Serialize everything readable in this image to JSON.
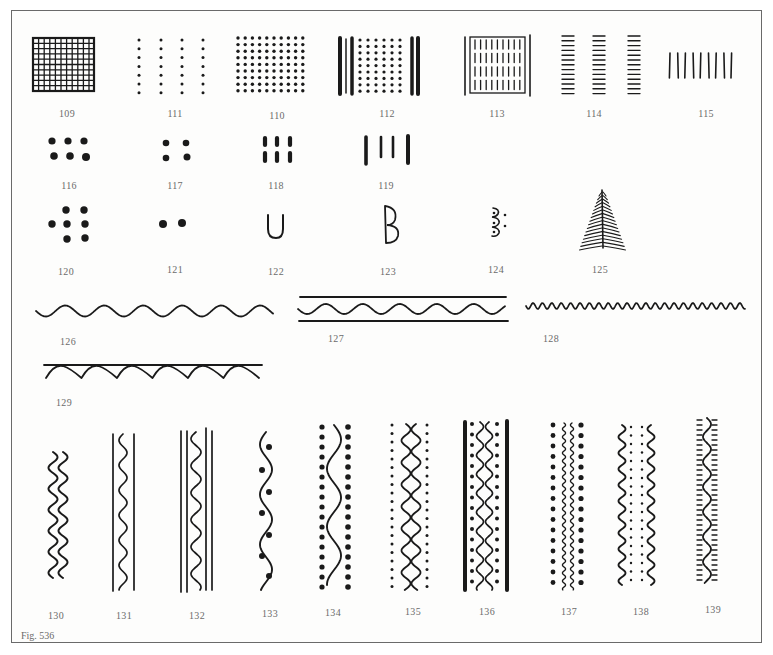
{
  "figure": {
    "caption": "Fig. 536",
    "ink_color": "#1a1a1a",
    "label_color": "#6b6b6b",
    "border_color": "#6a6a6a"
  },
  "motifs": [
    {
      "id": "109",
      "label": "109",
      "type": "cross-hatched grid square",
      "x": 67,
      "y": 108
    },
    {
      "id": "111",
      "label": "111",
      "type": "four vertical columns of dots",
      "x": 175,
      "y": 108
    },
    {
      "id": "110",
      "label": "110",
      "type": "dense square dot grid",
      "x": 277,
      "y": 110
    },
    {
      "id": "112",
      "label": "112",
      "type": "dot grid flanked by vertical bars",
      "x": 387,
      "y": 108
    },
    {
      "id": "113",
      "label": "113",
      "type": "framed vertical hatching in rows",
      "x": 497,
      "y": 108
    },
    {
      "id": "114",
      "label": "114",
      "type": "three columns of horizontal dashes",
      "x": 594,
      "y": 108
    },
    {
      "id": "115",
      "label": "115",
      "type": "row of vertical strokes",
      "x": 706,
      "y": 108
    },
    {
      "id": "116",
      "label": "116",
      "type": "six dots in 3x2 block",
      "x": 69,
      "y": 180
    },
    {
      "id": "117",
      "label": "117",
      "type": "four dots in 2x2 block",
      "x": 175,
      "y": 180
    },
    {
      "id": "118",
      "label": "118",
      "type": "six short dashes in 3x2 block",
      "x": 276,
      "y": 180
    },
    {
      "id": "119",
      "label": "119",
      "type": "four vertical bars",
      "x": 386,
      "y": 180
    },
    {
      "id": "120",
      "label": "120",
      "type": "seven dots in hexagonal cluster",
      "x": 66,
      "y": 266
    },
    {
      "id": "121",
      "label": "121",
      "type": "pair of dots",
      "x": 175,
      "y": 264
    },
    {
      "id": "122",
      "label": "122",
      "type": "U-shaped arc",
      "x": 276,
      "y": 266
    },
    {
      "id": "123",
      "label": "123",
      "type": "B-shaped double loop",
      "x": 388,
      "y": 266
    },
    {
      "id": "124",
      "label": "124",
      "type": "stacked arcs with dots",
      "x": 496,
      "y": 264
    },
    {
      "id": "125",
      "label": "125",
      "type": "fir tree / herringbone",
      "x": 600,
      "y": 264
    },
    {
      "id": "126",
      "label": "126",
      "type": "horizontal wavy line",
      "x": 68,
      "y": 336
    },
    {
      "id": "127",
      "label": "127",
      "type": "wavy line between two rules",
      "x": 336,
      "y": 333
    },
    {
      "id": "128",
      "label": "128",
      "type": "tight horizontal zigzag wave",
      "x": 551,
      "y": 333
    },
    {
      "id": "129",
      "label": "129",
      "type": "wavy line hanging from rule",
      "x": 64,
      "y": 397
    },
    {
      "id": "130",
      "label": "130",
      "type": "two parallel vertical waves",
      "x": 56,
      "y": 610
    },
    {
      "id": "131",
      "label": "131",
      "type": "vertical wave between two rules",
      "x": 124,
      "y": 610
    },
    {
      "id": "132",
      "label": "132",
      "type": "vertical wave between double rules",
      "x": 197,
      "y": 610
    },
    {
      "id": "133",
      "label": "133",
      "type": "vertical wave with dots in loops",
      "x": 270,
      "y": 608
    },
    {
      "id": "134",
      "label": "134",
      "type": "vertical wave between dot columns",
      "x": 333,
      "y": 607
    },
    {
      "id": "135",
      "label": "135",
      "type": "double wave between small dot columns",
      "x": 413,
      "y": 606
    },
    {
      "id": "136",
      "label": "136",
      "type": "double wave, dots and thick bars",
      "x": 487,
      "y": 606
    },
    {
      "id": "137",
      "label": "137",
      "type": "thin wavy lines between dot columns",
      "x": 569,
      "y": 606
    },
    {
      "id": "138",
      "label": "138",
      "type": "dotted band between two waves",
      "x": 641,
      "y": 606
    },
    {
      "id": "139",
      "label": "139",
      "type": "wave with dash fringe",
      "x": 713,
      "y": 604
    }
  ]
}
